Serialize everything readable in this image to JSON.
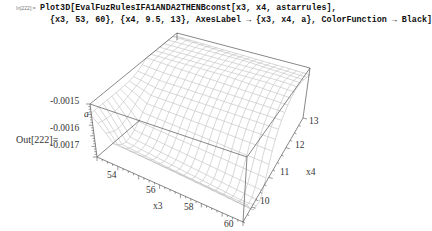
{
  "cell": {
    "input_label": "In[222]:=",
    "code_line1": "Plot3D[EvalFuzRulesIFA1ANDA2THENBconst[x3, x4, astarrules],",
    "code_line2": "{x3, 53, 60}, {x4, 9.5, 13}, AxesLabel → {x3, x4, a}, ColorFunction → Black]",
    "output_label": "Out[222]="
  },
  "plot": {
    "type": "surface3d",
    "axes_labels": {
      "x": "x3",
      "y": "x4",
      "z": "a"
    },
    "x_ticks": [
      "54",
      "56",
      "58",
      "60"
    ],
    "y_ticks": [
      "10",
      "11",
      "12",
      "13"
    ],
    "z_ticks": [
      "-0.0015",
      "-0.0016",
      "-0.0017"
    ],
    "x_range": [
      53,
      60
    ],
    "y_range": [
      9.5,
      13
    ],
    "mesh_color": "#b8b8b8",
    "box_color": "#444444"
  }
}
